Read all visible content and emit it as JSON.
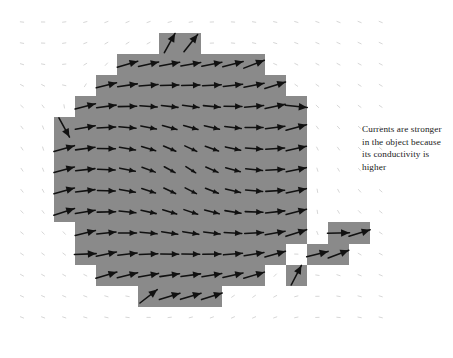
{
  "figure": {
    "width": 453,
    "height": 358,
    "background_color": "#ffffff"
  },
  "annotation": {
    "text": "Currents are stronger in the object because its conductivity is higher",
    "color": "#1a1a1a",
    "x": 362,
    "y": 123,
    "width": 86
  },
  "chart_data": {
    "type": "scatter",
    "subtype": "vector-field-quiver",
    "title": "",
    "subtitle": "",
    "xlabel": "",
    "ylabel": "",
    "grid": false,
    "legend_position": "none",
    "axis_visible": false,
    "xlim": [
      0,
      453
    ],
    "ylim": [
      0,
      358
    ],
    "annotations": [
      {
        "text": "Currents are stronger in the object because its conductivity is higher",
        "x": 362,
        "y": 123
      }
    ],
    "grid_spec": {
      "origin_x": 22,
      "origin_y": 22,
      "spacing": 21.1,
      "cols": 18,
      "rows": 15,
      "note": "vector sample points on a regular lattice"
    },
    "object_region": {
      "fill_color": "#8a8a8a",
      "shape": "pixelated-disk",
      "center_x": 184.5,
      "center_y": 172.5,
      "radius_cells": 6.2,
      "note": "conductive object rendered as a staircase-quantized circle of grid cells"
    },
    "detached_cells": [
      {
        "col": 13,
        "row": 12
      },
      {
        "col": 14,
        "row": 11
      },
      {
        "col": 15,
        "row": 11
      },
      {
        "col": 15,
        "row": 10
      },
      {
        "col": 16,
        "row": 10
      }
    ],
    "arrow_style": {
      "color_inside": "#111111",
      "color_outside": "#c8c8c8",
      "scale_inside": 1.0,
      "scale_outside": 0.17,
      "note": "arrow length is proportional to current density magnitude; inside the object currents are much stronger"
    },
    "field_model": {
      "description": "uniform applied field distorted by a highly conductive circular inclusion; streamlines circulate from upper-left inward and exit lower-right",
      "applied_direction_deg": 35,
      "dipole_strength": 1.0
    },
    "series": [
      {
        "name": "current density J (inside object)",
        "color": "#111111",
        "magnitude_relative": 1.0
      },
      {
        "name": "current density J (background medium)",
        "color": "#c8c8c8",
        "magnitude_relative": 0.17
      }
    ]
  }
}
